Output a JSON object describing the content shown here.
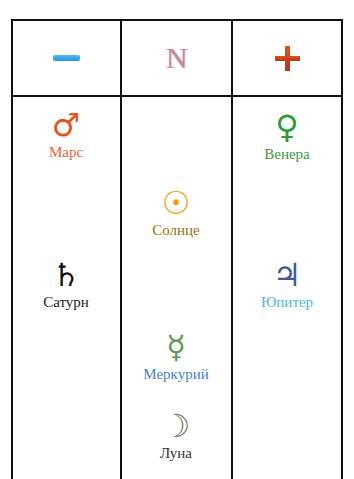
{
  "header": {
    "columns": [
      {
        "id": "negative",
        "symbol": "minus",
        "color": "#2a9ee0"
      },
      {
        "id": "neutral",
        "symbol": "N",
        "color": "#c8879c"
      },
      {
        "id": "positive",
        "symbol": "plus",
        "color": "#c8401c"
      }
    ]
  },
  "planets": {
    "mars": {
      "label": "Марс",
      "glyph": "♂",
      "color": "#e8501c",
      "column": "negative"
    },
    "saturn": {
      "label": "Сатурн",
      "glyph": "♄",
      "color": "#111111",
      "column": "negative"
    },
    "sun": {
      "label": "Солнце",
      "glyph": "☉",
      "color": "#e0a010",
      "column": "neutral"
    },
    "mercury": {
      "label": "Меркурий",
      "glyph": "☿",
      "color": "#5a9a50",
      "column": "neutral"
    },
    "moon": {
      "label": "Луна",
      "glyph": "☽",
      "color": "#6a6a60",
      "column": "neutral"
    },
    "venus": {
      "label": "Венера",
      "glyph": "♀",
      "color": "#2e9a3a",
      "column": "positive"
    },
    "jupiter": {
      "label": "Юпитер",
      "glyph": "♃",
      "color": "#3a5aa0",
      "column": "positive"
    }
  },
  "header_symbols": {
    "neutral": "N"
  }
}
